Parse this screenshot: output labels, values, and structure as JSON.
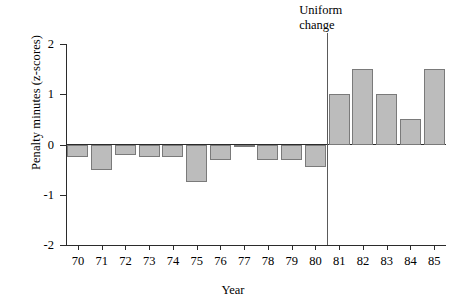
{
  "chart_data": {
    "type": "bar",
    "title": "",
    "xlabel": "Year",
    "ylabel": "Penalty minutes (z-scores)",
    "categories": [
      "70",
      "71",
      "72",
      "73",
      "74",
      "75",
      "76",
      "77",
      "78",
      "79",
      "80",
      "81",
      "82",
      "83",
      "84",
      "85"
    ],
    "values": [
      -0.25,
      -0.5,
      -0.2,
      -0.25,
      -0.25,
      -0.75,
      -0.3,
      -0.05,
      -0.3,
      -0.3,
      -0.45,
      1.0,
      1.5,
      1.0,
      0.5,
      1.5
    ],
    "ylim": [
      -2,
      2
    ],
    "yticks": [
      2,
      1,
      0,
      -1,
      -2
    ],
    "ytick_labels": [
      "2",
      "1",
      "0",
      "-1",
      "-2"
    ],
    "grid": false,
    "legend": false,
    "annotations": [
      {
        "text": "Uniform\nchange",
        "between_categories": [
          "80",
          "81"
        ],
        "style": "vertical-line-with-label"
      }
    ],
    "colors": {
      "bar_fill": "#bcbcbc",
      "bar_stroke": "#7a7a7a",
      "axis": "#2b2b2b",
      "annotation_line": "#5a5a5a",
      "text": "#000000",
      "background": "#ffffff"
    }
  }
}
